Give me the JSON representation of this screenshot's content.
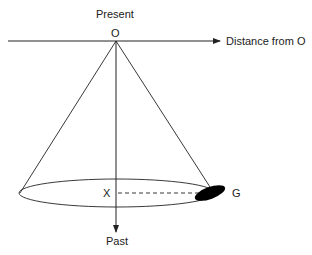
{
  "labels": {
    "present": "Present",
    "origin": "O",
    "distance_axis": "Distance from O",
    "x_point": "X",
    "galaxy": "G",
    "past": "Past"
  },
  "colors": {
    "line": "#222222",
    "fill": "#000000",
    "background": "#ffffff"
  }
}
